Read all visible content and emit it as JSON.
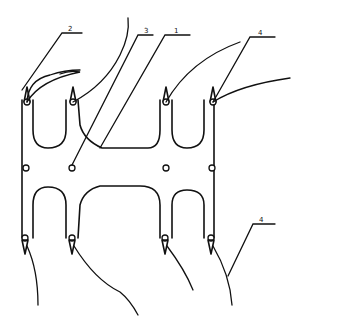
{
  "figure": {
    "type": "patent-line-drawing",
    "labels": [
      {
        "id": "label-2",
        "text": "2"
      },
      {
        "id": "label-3",
        "text": "3"
      },
      {
        "id": "label-1",
        "text": "1"
      },
      {
        "id": "label-4-top",
        "text": "4"
      },
      {
        "id": "label-4-bottom",
        "text": "4"
      }
    ],
    "colors": {
      "line": "#111111",
      "background": "#ffffff"
    }
  }
}
